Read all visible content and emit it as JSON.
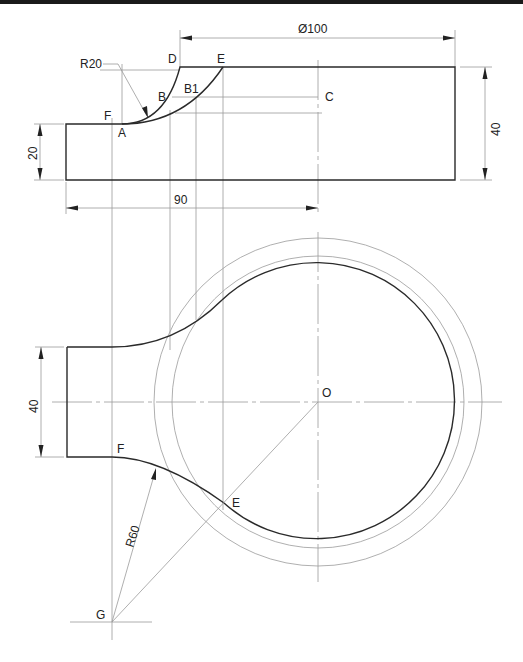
{
  "drawing": {
    "type": "engineering-drawing",
    "views": [
      "front-view",
      "top-view"
    ],
    "front_view": {
      "labels": {
        "R20": "R20",
        "D": "D",
        "E": "E",
        "B": "B",
        "B1": "B1",
        "C": "C",
        "F": "F",
        "A": "A"
      },
      "dimensions": {
        "diameter": "Ø100",
        "height_right": "40",
        "height_left": "20",
        "length": "90"
      }
    },
    "top_view": {
      "labels": {
        "O": "O",
        "F": "F",
        "E": "E",
        "G": "G",
        "R60": "R60"
      },
      "dimensions": {
        "width": "40"
      }
    },
    "colors": {
      "outline": "#2a2a2a",
      "construction": "#9a9a9a",
      "background": "#ffffff"
    }
  }
}
